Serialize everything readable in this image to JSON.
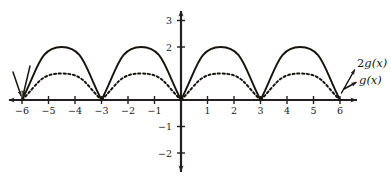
{
  "figure": {
    "title": "",
    "background_color": "#ffffff",
    "ink_color": "#17140f"
  },
  "chart_data": {
    "type": "line",
    "title": "",
    "xlabel": "",
    "ylabel": "",
    "xlim": [
      -6.5,
      6.6
    ],
    "ylim": [
      -2.6,
      3.3
    ],
    "grid": false,
    "legend": "inline-annotations",
    "x_ticks": [
      -6,
      -5,
      -4,
      -3,
      -2,
      -1,
      1,
      2,
      3,
      4,
      5,
      6
    ],
    "x_tick_labels": [
      "−6",
      "−5",
      "−4",
      "−3",
      "−2",
      "−1",
      "1",
      "2",
      "3",
      "4",
      "5",
      "6"
    ],
    "y_ticks": [
      3,
      2,
      -1,
      -2
    ],
    "y_tick_labels": [
      "3",
      "2",
      "−1",
      "−2"
    ],
    "x_axis_range_drawn": [
      -6.55,
      6.65
    ],
    "y_axis_range_drawn": [
      -2.75,
      3.45
    ],
    "period": 3,
    "zeros": [
      -6,
      -3,
      0,
      3,
      6
    ],
    "series": [
      {
        "name": "2g(x)",
        "label": "2g(x)",
        "style": "solid",
        "amplitude": 2,
        "peaks_x": [
          -4.5,
          -1.5,
          1.5,
          4.5
        ],
        "peaks_y": [
          2,
          2,
          2,
          2
        ],
        "x": [
          -6,
          -5.5,
          -5,
          -4.5,
          -4,
          -3.5,
          -3,
          -2.5,
          -2,
          -1.5,
          -1,
          -0.5,
          0,
          0.5,
          1,
          1.5,
          2,
          2.5,
          3,
          3.5,
          4,
          4.5,
          5,
          5.5,
          6
        ],
        "y": [
          0,
          1.49,
          1.89,
          2,
          1.89,
          1.49,
          0,
          1.49,
          1.89,
          2,
          1.89,
          1.49,
          0,
          1.49,
          1.89,
          2,
          1.89,
          1.49,
          0,
          1.49,
          1.89,
          2,
          1.89,
          1.49,
          0
        ]
      },
      {
        "name": "g(x)",
        "label": "g(x)",
        "style": "dashed",
        "amplitude": 1,
        "peaks_x": [
          -4.5,
          -1.5,
          1.5,
          4.5
        ],
        "peaks_y": [
          1,
          1,
          1,
          1
        ],
        "x": [
          -6,
          -5.5,
          -5,
          -4.5,
          -4,
          -3.5,
          -3,
          -2.5,
          -2,
          -1.5,
          -1,
          -0.5,
          0,
          0.5,
          1,
          1.5,
          2,
          2.5,
          3,
          3.5,
          4,
          4.5,
          5,
          5.5,
          6
        ],
        "y": [
          0,
          0.745,
          0.943,
          1,
          0.943,
          0.745,
          0,
          0.745,
          0.943,
          1,
          0.943,
          0.745,
          0,
          0.745,
          0.943,
          1,
          0.943,
          0.745,
          0,
          0.745,
          0.943,
          1,
          0.943,
          0.745,
          0
        ]
      }
    ],
    "annotations": [
      {
        "name": "label-2gx",
        "text": "2g(x)",
        "text_math_prefix": "2",
        "text_math_fn": "g",
        "points_to": "solid curve right endpoint"
      },
      {
        "name": "label-gx",
        "text": "g(x)",
        "text_math_fn": "g",
        "points_to": "dashed curve right endpoint"
      }
    ]
  },
  "labels": {
    "x_ticks": {
      "m6": "−6",
      "m5": "−5",
      "m4": "−4",
      "m3": "−3",
      "m2": "−2",
      "m1": "−1",
      "p1": "1",
      "p2": "2",
      "p3": "3",
      "p4": "4",
      "p5": "5",
      "p6": "6"
    },
    "y_ticks": {
      "p3": "3",
      "p2": "2",
      "m1": "−1",
      "m2": "−2"
    },
    "curves": {
      "two_g": "2g(x)",
      "two_g_coef": "2",
      "two_g_fn": "g",
      "two_g_arg": "(x)",
      "g": "g(x)",
      "g_fn": "g",
      "g_arg": "(x)"
    }
  }
}
